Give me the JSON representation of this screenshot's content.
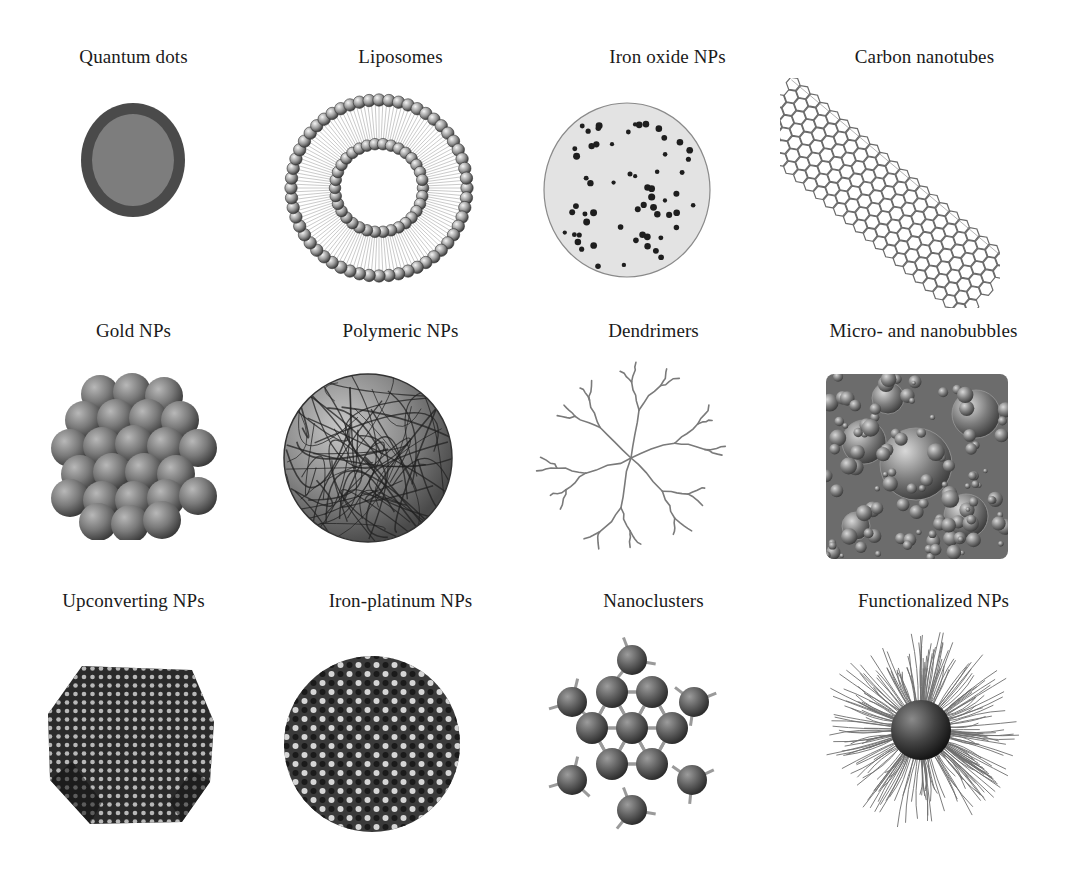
{
  "figure": {
    "panels": [
      {
        "id": "quantum-dots",
        "label": "Quantum dots",
        "kind": "core-shell-sphere"
      },
      {
        "id": "liposomes",
        "label": "Liposomes",
        "kind": "lipid-bilayer-ring"
      },
      {
        "id": "iron-oxide-nps",
        "label": "Iron oxide NPs",
        "kind": "dotted-disc"
      },
      {
        "id": "carbon-nanotubes",
        "label": "Carbon nanotubes",
        "kind": "hexagonal-tube"
      },
      {
        "id": "gold-nps",
        "label": "Gold NPs",
        "kind": "sphere-cluster"
      },
      {
        "id": "polymeric-nps",
        "label": "Polymeric NPs",
        "kind": "tangled-sphere"
      },
      {
        "id": "dendrimers",
        "label": "Dendrimers",
        "kind": "branched-tree"
      },
      {
        "id": "micro-nanobubbles",
        "label": "Micro- and nanobubbles",
        "kind": "bubble-square"
      },
      {
        "id": "upconverting-nps",
        "label": "Upconverting NPs",
        "kind": "faceted-lattice"
      },
      {
        "id": "iron-platinum-nps",
        "label": "Iron-platinum NPs",
        "kind": "lattice-sphere"
      },
      {
        "id": "nanoclusters",
        "label": "Nanoclusters",
        "kind": "atomic-cluster"
      },
      {
        "id": "functionalized-nps",
        "label": "Functionalized NPs",
        "kind": "hairy-sphere"
      }
    ]
  }
}
